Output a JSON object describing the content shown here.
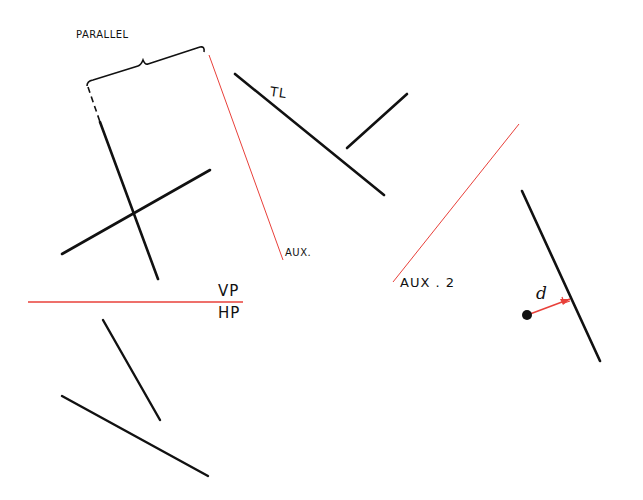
{
  "colors": {
    "ink": "#111111",
    "construction": "#e8403a",
    "background": "#ffffff"
  },
  "labels": {
    "parallel": "PARALLEL",
    "tl": "TL",
    "aux1": "AUX.",
    "aux2": "AUX . 2",
    "vp": "VP",
    "hp": "HP",
    "distance": "d"
  },
  "elements": {
    "black_lines": [
      {
        "name": "parallel-left-line",
        "x1": 100,
        "y1": 122,
        "x2": 158,
        "y2": 279
      },
      {
        "name": "crossing-line",
        "x1": 62,
        "y1": 254,
        "x2": 210,
        "y2": 170
      },
      {
        "name": "true-length-line",
        "x1": 235,
        "y1": 74,
        "x2": 384,
        "y2": 195
      },
      {
        "name": "short-line",
        "x1": 347,
        "y1": 148,
        "x2": 407,
        "y2": 94
      },
      {
        "name": "right-line",
        "x1": 522,
        "y1": 191,
        "x2": 600,
        "y2": 361
      },
      {
        "name": "lower-short-line",
        "x1": 103,
        "y1": 320,
        "x2": 160,
        "y2": 420
      },
      {
        "name": "lower-long-line",
        "x1": 62,
        "y1": 396,
        "x2": 208,
        "y2": 476
      }
    ],
    "red_lines": [
      {
        "name": "aux-1-line",
        "x1": 209,
        "y1": 55,
        "x2": 283,
        "y2": 260
      },
      {
        "name": "aux-2-line",
        "x1": 519,
        "y1": 124,
        "x2": 393,
        "y2": 282
      },
      {
        "name": "vp-hp-folding-line",
        "x1": 28,
        "y1": 302,
        "x2": 243,
        "y2": 302
      },
      {
        "name": "distance-line",
        "x1": 528,
        "y1": 315,
        "x2": 570,
        "y2": 299
      }
    ],
    "point": {
      "cx": 527,
      "cy": 315,
      "r": 5
    }
  }
}
